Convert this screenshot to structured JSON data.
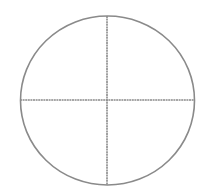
{
  "diagram": {
    "shape": "circle-divided-into-quadrants",
    "stroke_color": "#8a8a8a",
    "background_color": "#ffffff",
    "circle": {
      "cx": 107.5,
      "cy": 100.5,
      "rx": 87,
      "ry": 84.5
    },
    "vertical_line": {
      "x": 107,
      "y1": 16,
      "y2": 185
    },
    "horizontal_line": {
      "y": 100,
      "x1": 20,
      "x2": 195
    }
  }
}
